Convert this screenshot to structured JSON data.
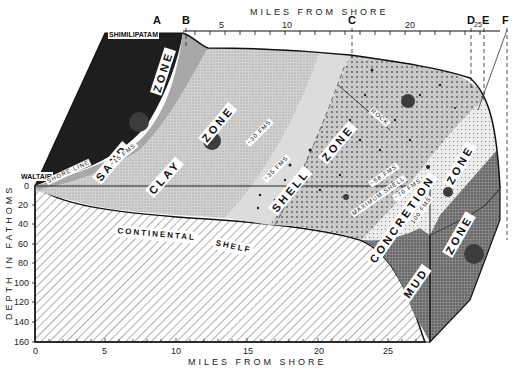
{
  "diagram": {
    "top_axis": {
      "title": "MILES FROM SHORE",
      "ticks": [
        "5",
        "10",
        "20",
        "25"
      ],
      "section_markers": [
        "A",
        "B",
        "C",
        "D",
        "E",
        "F"
      ]
    },
    "bottom_axis": {
      "title": "MILES FROM SHORE",
      "ticks": [
        "0",
        "5",
        "10",
        "15",
        "20",
        "25"
      ]
    },
    "left_axis": {
      "title": "DEPTH IN FATHOMS",
      "ticks": [
        "0",
        "20",
        "40",
        "60",
        "80",
        "100",
        "120",
        "140",
        "160"
      ]
    },
    "places": {
      "north": "SHIMILIPATAM",
      "south": "WALTAIR"
    },
    "zones": {
      "sand": "SAND",
      "sand_zone": "ZONE",
      "clay": "CLAY",
      "clay_zone": "ZONE",
      "shell": "SHELL",
      "shell_zone": "ZONE",
      "concretion": "CONCRETION",
      "concretion_zone": "ZONE",
      "mud": "MUD",
      "mud_zone": "ZONE",
      "shelf": "CONTINENTAL",
      "shelf2": "SHELF"
    },
    "annotations": {
      "shore_line": "SHORE LINE",
      "fms15": "~15 FMS",
      "fms30": "~30 FMS",
      "fms35": "~35 FMS",
      "fms58": "~58 FMS",
      "fms70": "~70 FMS",
      "maximum_shell": "MAXIMUM SHELL",
      "rock": "ROCK",
      "fms100": "100 FMS"
    },
    "colors": {
      "land": "#1e1e1e",
      "sand": "#a8a8a8",
      "clay": "#cfcfcf",
      "shell_light": "#dcdcdc",
      "shell_dotted": "#bdbdbd",
      "concretion": "#e6e6e6",
      "mud": "#7a7a7a",
      "sample_dot": "#3c3c3c"
    }
  }
}
